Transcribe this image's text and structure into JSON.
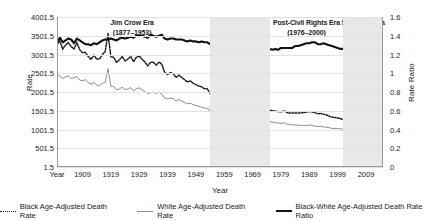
{
  "chart_data": {
    "type": "line",
    "title": "",
    "xlabel": "Year",
    "ylabel": "Rate",
    "ylabel_right": "Rate Ratio",
    "x": [
      1900,
      1901,
      1902,
      1903,
      1904,
      1905,
      1906,
      1907,
      1908,
      1909,
      1910,
      1911,
      1912,
      1913,
      1914,
      1915,
      1916,
      1917,
      1918,
      1919,
      1920,
      1921,
      1922,
      1923,
      1924,
      1925,
      1926,
      1927,
      1928,
      1929,
      1930,
      1931,
      1932,
      1933,
      1934,
      1935,
      1936,
      1937,
      1938,
      1939,
      1940,
      1941,
      1942,
      1943,
      1944,
      1945,
      1946,
      1947,
      1948,
      1949,
      1950,
      1951,
      1952,
      1953,
      1954,
      1955,
      1956,
      1957,
      1958,
      1959,
      1960,
      1961,
      1962,
      1963,
      1964,
      1965,
      1966,
      1967,
      1968,
      1969,
      1970,
      1971,
      1972,
      1973,
      1974,
      1975,
      1976,
      1977,
      1978,
      1979,
      1980,
      1981,
      1982,
      1983,
      1984,
      1985,
      1986,
      1987,
      1988,
      1989,
      1990,
      1991,
      1992,
      1993,
      1994,
      1995,
      1996,
      1997,
      1998,
      1999,
      2000,
      2001,
      2002,
      2003,
      2004,
      2005,
      2006,
      2007,
      2008,
      2009,
      2010,
      2011,
      2012,
      2013,
      2014,
      2015
    ],
    "xlim": [
      1900,
      2015
    ],
    "ylim_left": [
      1.5,
      4001.5
    ],
    "ylim_right": [
      0,
      1.6
    ],
    "yticks_left": [
      "1.5",
      "501.5",
      "1001.5",
      "1501.5",
      "2001.5",
      "2501.5",
      "3001.5",
      "3501.5",
      "4001.5"
    ],
    "yticks_right": [
      "0",
      "0.2",
      "0.4",
      "0.6",
      "0.8",
      "1",
      "1.2",
      "1.4",
      "1.6"
    ],
    "xticks": [
      "Year",
      "1909",
      "1919",
      "1929",
      "1939",
      "1949",
      "1959",
      "1969",
      "1979",
      "1989",
      "1999",
      "2009"
    ],
    "xtick_values": [
      1900,
      1909,
      1919,
      1929,
      1939,
      1949,
      1959,
      1969,
      1979,
      1989,
      1999,
      2009
    ],
    "grid": true,
    "legend_position": "bottom",
    "series": [
      {
        "name": "Black Age-Adjusted Death Rate",
        "style": "dotted",
        "color": "#1b1b1b",
        "axis": "left",
        "values": [
          3280,
          3350,
          3150,
          3250,
          3320,
          3210,
          3150,
          3320,
          3130,
          3050,
          3060,
          2950,
          2870,
          2980,
          2880,
          2880,
          3000,
          3080,
          3560,
          2940,
          2930,
          2790,
          2860,
          2950,
          2830,
          2880,
          2950,
          2810,
          2930,
          2960,
          2880,
          2800,
          2700,
          2790,
          2800,
          2720,
          2800,
          2740,
          2520,
          2470,
          2520,
          2490,
          2390,
          2450,
          2390,
          2330,
          2270,
          2300,
          2240,
          2200,
          2160,
          2140,
          2090,
          2090,
          1960,
          1980,
          1960,
          1990,
          1930,
          1940,
          1930,
          1880,
          1890,
          1900,
          1850,
          1830,
          1800,
          1760,
          1770,
          1740,
          1710,
          1670,
          1650,
          1620,
          1560,
          1520,
          1500,
          1490,
          1480,
          1470,
          1500,
          1460,
          1440,
          1440,
          1440,
          1440,
          1440,
          1450,
          1470,
          1480,
          1470,
          1450,
          1420,
          1430,
          1410,
          1390,
          1360,
          1330,
          1320,
          1310,
          1290,
          1270,
          1260,
          1230,
          1200,
          1180,
          1140,
          1110,
          1090,
          1060,
          1040,
          1010,
          1000,
          980,
          960,
          940
        ]
      },
      {
        "name": "White Age-Adjusted Death Rate",
        "style": "solid-thin",
        "color": "#8d8d8d",
        "axis": "left",
        "values": [
          2480,
          2420,
          2360,
          2400,
          2430,
          2360,
          2380,
          2420,
          2320,
          2300,
          2330,
          2250,
          2210,
          2250,
          2190,
          2170,
          2230,
          2260,
          2620,
          2150,
          2150,
          2060,
          2080,
          2130,
          2070,
          2080,
          2120,
          2030,
          2090,
          2110,
          2060,
          2010,
          1960,
          1980,
          2000,
          1960,
          2000,
          1940,
          1840,
          1820,
          1840,
          1820,
          1760,
          1800,
          1760,
          1720,
          1690,
          1700,
          1670,
          1640,
          1620,
          1600,
          1570,
          1570,
          1500,
          1510,
          1500,
          1520,
          1480,
          1480,
          1470,
          1440,
          1440,
          1460,
          1430,
          1420,
          1410,
          1380,
          1390,
          1370,
          1350,
          1320,
          1310,
          1290,
          1250,
          1210,
          1200,
          1180,
          1180,
          1160,
          1180,
          1150,
          1130,
          1130,
          1120,
          1120,
          1110,
          1110,
          1110,
          1120,
          1110,
          1090,
          1080,
          1090,
          1070,
          1060,
          1050,
          1030,
          1030,
          1030,
          1020,
          1010,
          1010,
          990,
          970,
          950,
          920,
          900,
          890,
          870,
          860,
          840,
          830,
          820,
          810,
          800
        ]
      },
      {
        "name": "Black-White Age-Adjusted Death Rate Ratio",
        "style": "solid-thick",
        "color": "#111111",
        "axis": "right",
        "values": [
          1.32,
          1.38,
          1.33,
          1.35,
          1.37,
          1.36,
          1.32,
          1.37,
          1.35,
          1.33,
          1.31,
          1.31,
          1.3,
          1.32,
          1.31,
          1.33,
          1.35,
          1.36,
          1.36,
          1.37,
          1.36,
          1.35,
          1.37,
          1.38,
          1.37,
          1.38,
          1.39,
          1.38,
          1.4,
          1.4,
          1.4,
          1.39,
          1.38,
          1.41,
          1.4,
          1.39,
          1.4,
          1.41,
          1.37,
          1.36,
          1.37,
          1.37,
          1.36,
          1.36,
          1.36,
          1.35,
          1.34,
          1.35,
          1.34,
          1.34,
          1.33,
          1.34,
          1.33,
          1.33,
          1.31,
          1.31,
          1.31,
          1.31,
          1.3,
          1.31,
          1.31,
          1.31,
          1.31,
          1.3,
          1.29,
          1.29,
          1.28,
          1.28,
          1.27,
          1.27,
          1.27,
          1.27,
          1.26,
          1.26,
          1.25,
          1.26,
          1.25,
          1.26,
          1.25,
          1.27,
          1.27,
          1.27,
          1.27,
          1.27,
          1.29,
          1.29,
          1.3,
          1.31,
          1.32,
          1.32,
          1.33,
          1.33,
          1.31,
          1.31,
          1.32,
          1.31,
          1.3,
          1.29,
          1.28,
          1.27,
          1.26,
          1.26,
          1.25,
          1.24,
          1.24,
          1.24,
          1.24,
          1.24,
          1.25,
          1.22,
          1.21,
          1.2,
          1.22,
          1.21,
          1.17,
          1.18
        ]
      }
    ],
    "eras": [
      {
        "label": "Jim Crow Era",
        "years": "(1877–1953)",
        "start": 1900,
        "end": 1953,
        "shaded": false
      },
      {
        "label": "Civil Rights Era",
        "years": "(1954–1975)",
        "start": 1954,
        "end": 1975,
        "shaded": true
      },
      {
        "label": "Post-Civil Rights Era",
        "years": "(1976–2000)",
        "start": 1976,
        "end": 2000,
        "shaded": false
      },
      {
        "label": "Sandoval Era",
        "years": "(2001–2015)",
        "start": 2001,
        "end": 2015,
        "shaded": true
      }
    ],
    "colors": {
      "band": "#e8e8e8",
      "grid": "#e2e2e2",
      "black_rate": "#1b1b1b",
      "white_rate": "#8d8d8d",
      "ratio": "#111111"
    }
  }
}
